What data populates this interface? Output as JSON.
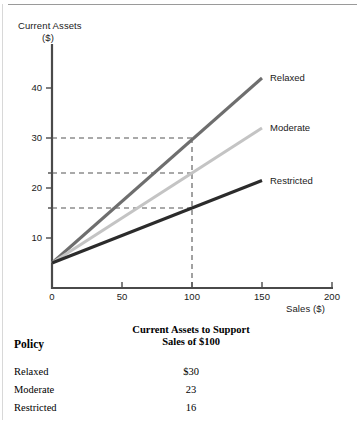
{
  "chart_data": {
    "type": "line",
    "title": "",
    "xlabel": "Sales ($)",
    "ylabel_line1": "Current Assets",
    "ylabel_line2": "($)",
    "x": [
      0,
      150
    ],
    "xlim": [
      0,
      200
    ],
    "ylim": [
      0,
      46
    ],
    "xticks": [
      "0",
      "50",
      "100",
      "150",
      "200"
    ],
    "xtick_values": [
      0,
      50,
      100,
      150,
      200
    ],
    "yticks": [
      "10",
      "20",
      "30",
      "40"
    ],
    "ytick_values": [
      10,
      20,
      30,
      40
    ],
    "grid": false,
    "legend_position": "right-inline",
    "intercept": 5,
    "series": [
      {
        "name": "Relaxed",
        "color": "#6e6e6e",
        "values": [
          5,
          42
        ],
        "value_at_100": 30
      },
      {
        "name": "Moderate",
        "color": "#c4c4c4",
        "values": [
          5,
          32
        ],
        "value_at_100": 23
      },
      {
        "name": "Restricted",
        "color": "#2b2b2b",
        "values": [
          5,
          21.5
        ],
        "value_at_100": 16
      }
    ],
    "annotations": {
      "vertical_dashed_x": 100,
      "horizontal_dashed_y": [
        30,
        23,
        16
      ],
      "dash_color": "#555555"
    }
  },
  "axis": {
    "color": "#4a4a4a"
  },
  "table": {
    "header_policy": "Policy",
    "header_value_line1": "Current Assets to Support",
    "header_value_line2": "Sales of $100",
    "rows": [
      {
        "policy": "Relaxed",
        "value": "$30"
      },
      {
        "policy": "Moderate",
        "value": "23"
      },
      {
        "policy": "Restricted",
        "value": "16"
      }
    ]
  }
}
